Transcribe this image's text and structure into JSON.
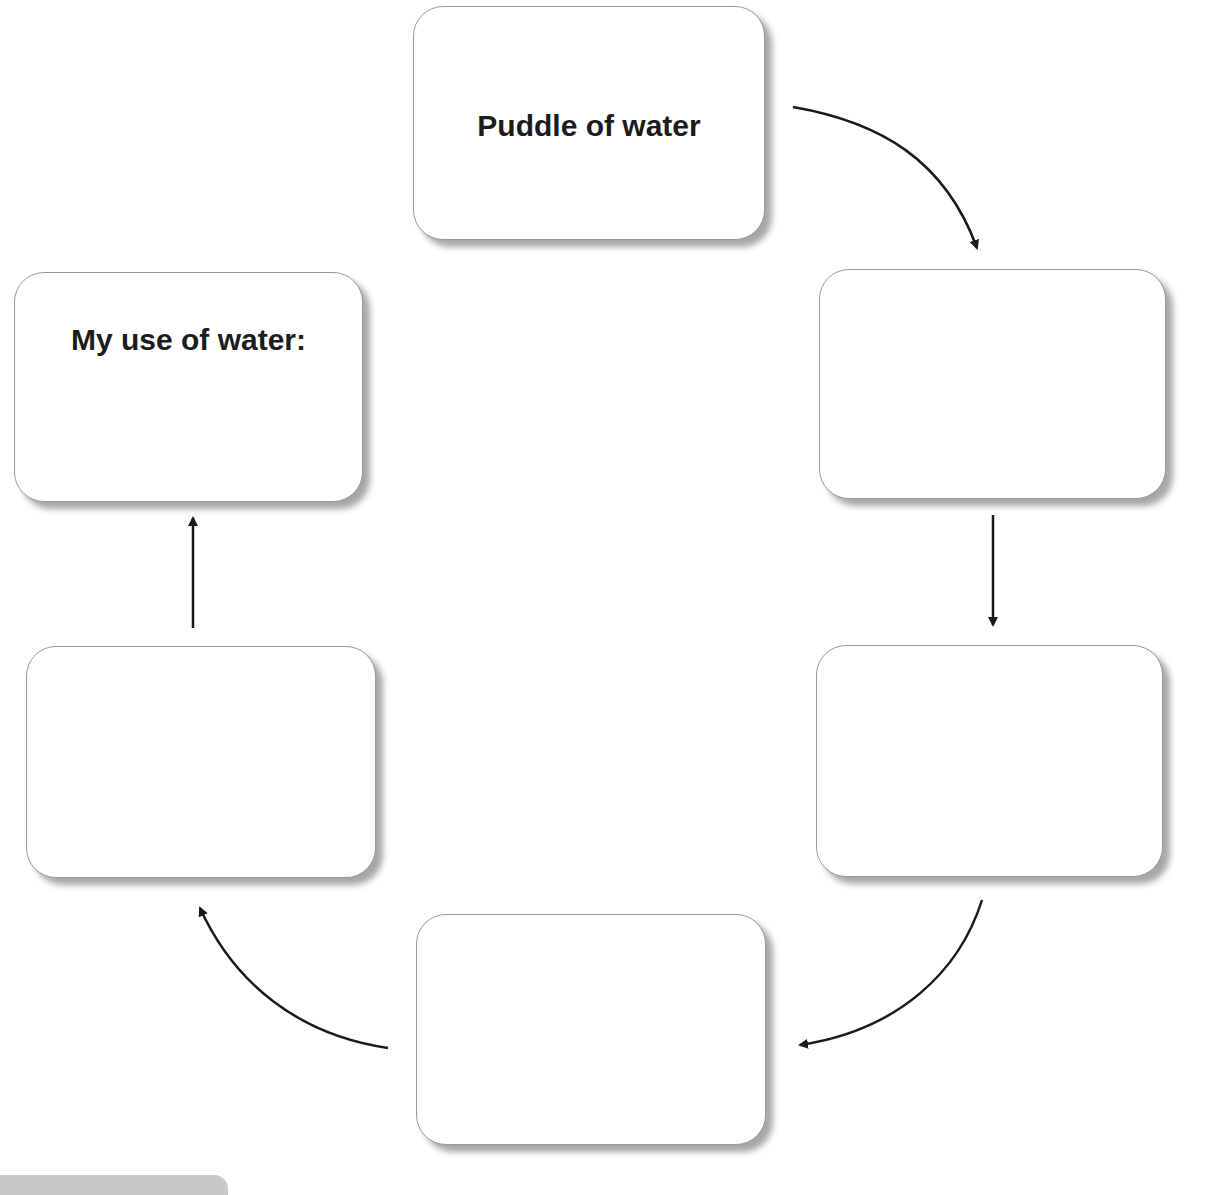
{
  "diagram": {
    "type": "cycle",
    "title": "",
    "boxes": [
      {
        "id": "box-1",
        "label": "Puddle of water",
        "position": "top-center"
      },
      {
        "id": "box-2",
        "label": "",
        "position": "right-upper"
      },
      {
        "id": "box-3",
        "label": "",
        "position": "right-lower"
      },
      {
        "id": "box-4",
        "label": "",
        "position": "bottom-center"
      },
      {
        "id": "box-5",
        "label": "",
        "position": "left-lower"
      },
      {
        "id": "box-6",
        "label": "My use of water:",
        "position": "left-upper"
      }
    ],
    "arrows": [
      {
        "from": "box-1",
        "to": "box-2",
        "style": "curved"
      },
      {
        "from": "box-2",
        "to": "box-3",
        "style": "straight"
      },
      {
        "from": "box-3",
        "to": "box-4",
        "style": "curved"
      },
      {
        "from": "box-4",
        "to": "box-5",
        "style": "curved"
      },
      {
        "from": "box-5",
        "to": "box-6",
        "style": "straight"
      }
    ],
    "colors": {
      "arrow": "#1a1a1a",
      "box_border": "#9a9a9a",
      "text": "#1c1c1c"
    }
  }
}
